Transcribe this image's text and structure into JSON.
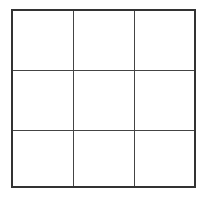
{
  "grid": {
    "rows": 3,
    "columns": 3,
    "line_color": "#333333",
    "background": "#ffffff",
    "cells": [
      [
        "",
        "",
        ""
      ],
      [
        "",
        "",
        ""
      ],
      [
        "",
        "",
        ""
      ]
    ]
  }
}
